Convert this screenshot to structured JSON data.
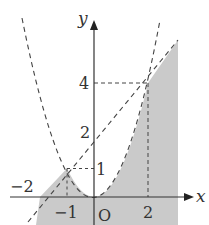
{
  "diagram": {
    "axis_labels": {
      "x": "x",
      "y": "y",
      "origin": "O"
    },
    "x_ticks": [
      {
        "value": -2,
        "label": "−2"
      },
      {
        "value": -1,
        "label": "−1"
      },
      {
        "value": 2,
        "label": "2"
      }
    ],
    "y_ticks": [
      {
        "value": 1,
        "label": "1"
      },
      {
        "value": 2,
        "label": "2"
      },
      {
        "value": 4,
        "label": "4"
      }
    ],
    "curves": [
      {
        "name": "parabola",
        "equation": "y = x^2",
        "style": "dashed"
      },
      {
        "name": "line",
        "equation": "y = x + 2",
        "style": "dashed"
      }
    ],
    "intersection_points": [
      {
        "x": -1,
        "y": 1
      },
      {
        "x": 2,
        "y": 4
      }
    ],
    "colors": {
      "shade": "#c8c8c8",
      "axis": "#333333",
      "dash": "#444444"
    }
  }
}
